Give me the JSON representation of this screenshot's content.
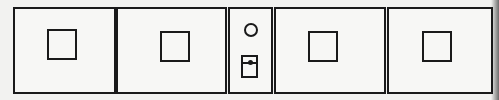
{
  "diagram": {
    "colors": {
      "stroke": "#1a1a1a",
      "background": "#f2f2f0",
      "panel_fill": "#f7f7f5"
    },
    "panels": [
      {
        "id": "panel-1",
        "content": "square-placeholder"
      },
      {
        "id": "panel-2",
        "content": "square-placeholder"
      },
      {
        "id": "panel-3",
        "content": "narrow-control",
        "elements": [
          "circle",
          "pocket-with-dot"
        ]
      },
      {
        "id": "panel-4",
        "content": "square-placeholder"
      },
      {
        "id": "panel-5",
        "content": "square-placeholder"
      }
    ]
  }
}
